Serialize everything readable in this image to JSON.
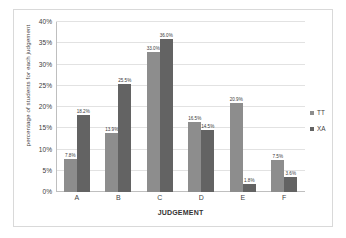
{
  "chart_data": {
    "type": "bar",
    "title": "",
    "subtitle": "",
    "xlabel": "JUDGEMENT",
    "ylabel": "percentage of students for each judgement",
    "categories": [
      "A",
      "B",
      "C",
      "D",
      "E",
      "F"
    ],
    "series": [
      {
        "name": "TT",
        "color": "#8d8d8d",
        "values": [
          7.8,
          13.9,
          33.0,
          16.5,
          20.9,
          7.5
        ],
        "labels": [
          "7.8%",
          "13.9%",
          "33.0%",
          "16.5%",
          "20.9%",
          "7.5%"
        ]
      },
      {
        "name": "XA",
        "color": "#636363",
        "values": [
          18.2,
          25.5,
          36.0,
          14.5,
          1.8,
          3.6
        ],
        "labels": [
          "18.2%",
          "25.5%",
          "36.0%",
          "14.5%",
          "1.8%",
          "3.6%"
        ]
      }
    ],
    "ylim": [
      0,
      40
    ],
    "ytick_values": [
      0,
      5,
      10,
      15,
      20,
      25,
      30,
      35,
      40
    ],
    "ytick_labels": [
      "0%",
      "5%",
      "10%",
      "15%",
      "20%",
      "25%",
      "30%",
      "35%",
      "40%"
    ],
    "grid": "horizontal",
    "legend_position": "right",
    "legend_entries": [
      "TT",
      "XA"
    ],
    "value_labels_shown": true
  },
  "colors": {
    "series_tt": "#8d8d8d",
    "series_xa": "#636363",
    "gridline": "#e2e2e2",
    "axis": "#bfbfbf",
    "frame": "#d9d9d9",
    "background": "#ffffff",
    "text": "#3f3f3f"
  }
}
